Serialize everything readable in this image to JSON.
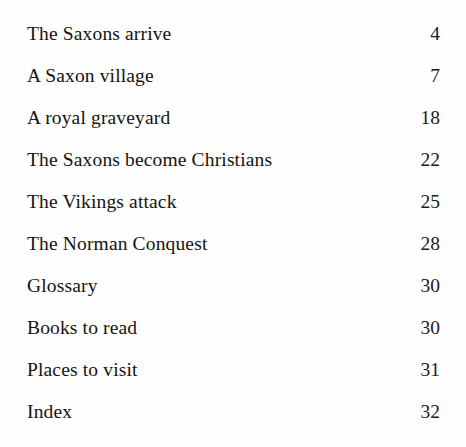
{
  "document": {
    "type": "table-of-contents",
    "background_color": "#fefefe",
    "text_color": "#161310",
    "entries": [
      {
        "title": "The Saxons arrive",
        "page": "4"
      },
      {
        "title": "A Saxon village",
        "page": "7"
      },
      {
        "title": "A royal graveyard",
        "page": "18"
      },
      {
        "title": "The Saxons become Christians",
        "page": "22"
      },
      {
        "title": "The Vikings attack",
        "page": "25"
      },
      {
        "title": "The Norman Conquest",
        "page": "28"
      },
      {
        "title": "Glossary",
        "page": "30"
      },
      {
        "title": "Books to read",
        "page": "30"
      },
      {
        "title": "Places to visit",
        "page": "31"
      },
      {
        "title": "Index",
        "page": "32"
      }
    ]
  }
}
